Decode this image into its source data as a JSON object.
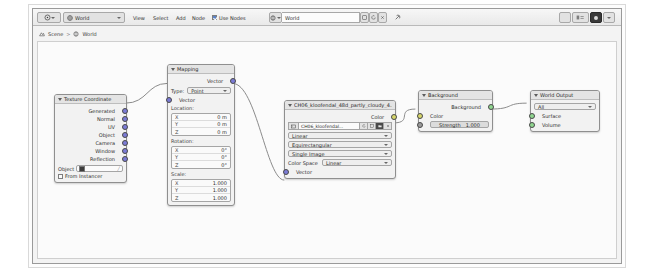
{
  "app": {
    "editor": "Shader Editor",
    "shader_type": "World"
  },
  "header": {
    "editor_type_icon": "shader-editor-icon",
    "shader_type_icon": "world-icon",
    "shader_type_label": "World",
    "menus": [
      "View",
      "Select",
      "Add",
      "Node"
    ],
    "use_nodes_label": "Use Nodes",
    "use_nodes_checked": true,
    "datablock": {
      "browse_icon": "world-browse-icon",
      "name": "World",
      "new_icon": "new-icon",
      "copy_icon": "copy-icon",
      "close_icon": "x-icon"
    },
    "pin_icon": "pin-icon",
    "right_buttons": [
      "snap-toggle",
      "overlays-toggle",
      "shading-solid",
      "shading-material"
    ]
  },
  "breadcrumb": {
    "scene_icon": "scene-icon",
    "scene": "Scene",
    "separator": ">",
    "world_icon": "world-icon",
    "world": "World"
  },
  "nodes": {
    "texture_coordinate": {
      "title": "Texture Coordinate",
      "outputs": [
        "Generated",
        "Normal",
        "UV",
        "Object",
        "Camera",
        "Window",
        "Reflection"
      ],
      "object_label": "Object",
      "object_value": "",
      "from_instancer_label": "From Instancer",
      "from_instancer_checked": false
    },
    "mapping": {
      "title": "Mapping",
      "output": "Vector",
      "type_label": "Type:",
      "type_value": "Point",
      "input": "Vector",
      "location_label": "Location:",
      "location": [
        {
          "axis": "X",
          "value": "0 m"
        },
        {
          "axis": "Y",
          "value": "0 m"
        },
        {
          "axis": "Z",
          "value": "0 m"
        }
      ],
      "rotation_label": "Rotation:",
      "rotation": [
        {
          "axis": "X",
          "value": "0°"
        },
        {
          "axis": "Y",
          "value": "0°"
        },
        {
          "axis": "Z",
          "value": "0°"
        }
      ],
      "scale_label": "Scale:",
      "scale": [
        {
          "axis": "X",
          "value": "1.000"
        },
        {
          "axis": "Y",
          "value": "1.000"
        },
        {
          "axis": "Z",
          "value": "1.000"
        }
      ]
    },
    "environment_texture": {
      "title": "CH06_kloofendal_48d_partly_cloudy_4...",
      "output": "Color",
      "image_name": "CH06_kloofendal...",
      "image_browse_icon": "image-browse-icon",
      "image_refresh_icon": "refresh-icon",
      "image_new_icon": "new-icon",
      "image_open_icon": "folder-icon",
      "image_close_icon": "x-icon",
      "interpolation": "Linear",
      "projection": "Equirectangular",
      "source": "Single Image",
      "color_space_label": "Color Space",
      "color_space_value": "Linear",
      "input": "Vector"
    },
    "background": {
      "title": "Background",
      "output": "Background",
      "color_label": "Color",
      "strength_label": "Strength",
      "strength_value": "1.000"
    },
    "world_output": {
      "title": "World Output",
      "target": "All",
      "inputs": [
        "Surface",
        "Volume"
      ]
    }
  },
  "colors": {
    "vector_socket": "#7b7bd6",
    "color_socket": "#d6d66a",
    "shader_socket": "#8fd68f",
    "checkbox_on": "#5b81c4"
  }
}
